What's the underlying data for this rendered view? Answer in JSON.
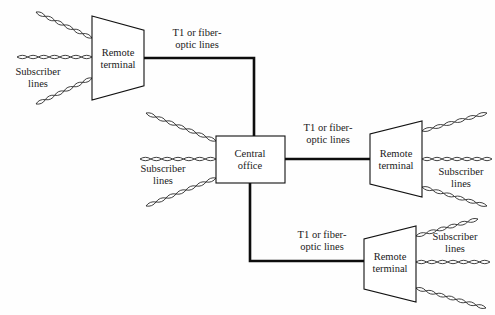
{
  "diagram": {
    "background_color": "#fefefe",
    "line_color": "#0d0d0d",
    "node_fill": "#ffffff",
    "nodes": [
      {
        "id": "rt-top-left",
        "label_line1": "Remote",
        "label_line2": "terminal",
        "shape": "trapezoid-left",
        "x": 92,
        "y": 16,
        "w": 52,
        "h": 84,
        "cx": 118,
        "cy": 58
      },
      {
        "id": "central-office",
        "label_line1": "Central",
        "label_line2": "office",
        "shape": "rectangle",
        "x": 216,
        "y": 136,
        "w": 69,
        "h": 47,
        "cx": 250,
        "cy": 159
      },
      {
        "id": "rt-mid-right",
        "label_line1": "Remote",
        "label_line2": "terminal",
        "shape": "trapezoid-right",
        "x": 370,
        "y": 121,
        "w": 52,
        "h": 76,
        "cx": 396,
        "cy": 159
      },
      {
        "id": "rt-bottom-right",
        "label_line1": "Remote",
        "label_line2": "terminal",
        "shape": "trapezoid-right",
        "x": 364,
        "y": 226,
        "w": 52,
        "h": 76,
        "cx": 390,
        "cy": 262
      }
    ],
    "trunk_labels": [
      {
        "id": "trunk-label-top",
        "line1": "T1 or fiber-",
        "line2": "optic lines",
        "x": 197,
        "y": 36
      },
      {
        "id": "trunk-label-mid",
        "line1": "T1 or fiber-",
        "line2": "optic lines",
        "x": 328,
        "y": 131
      },
      {
        "id": "trunk-label-bottom",
        "line1": "T1 or fiber-",
        "line2": "optic lines",
        "x": 322,
        "y": 238
      }
    ],
    "subscriber_labels": [
      {
        "id": "sub-label-top-left",
        "line1": "Subscriber",
        "line2": "lines",
        "x": 38,
        "y": 75
      },
      {
        "id": "sub-label-center",
        "line1": "Subscriber",
        "line2": "lines",
        "x": 163,
        "y": 172
      },
      {
        "id": "sub-label-mid-right",
        "line1": "Subscriber",
        "line2": "lines",
        "x": 461,
        "y": 175
      },
      {
        "id": "sub-label-bottom-right",
        "line1": "Subscriber",
        "line2": "lines",
        "x": 455,
        "y": 240
      }
    ],
    "trunk_paths": [
      {
        "id": "trunk-top",
        "d": "M 144 58 L 254 58 L 254 136"
      },
      {
        "id": "trunk-mid",
        "d": "M 285 159 L 370 159"
      },
      {
        "id": "trunk-bottom",
        "d": "M 250 183 L 250 261 L 364 261"
      }
    ],
    "subscriber_links": [
      {
        "id": "sub-top-left-upper",
        "x1": 36,
        "y1": 12,
        "x2": 92,
        "y2": 38
      },
      {
        "id": "sub-top-left-middle",
        "x1": 17,
        "y1": 57,
        "x2": 92,
        "y2": 57
      },
      {
        "id": "sub-top-left-lower",
        "x1": 36,
        "y1": 104,
        "x2": 92,
        "y2": 78
      },
      {
        "id": "sub-central-upper",
        "x1": 146,
        "y1": 113,
        "x2": 216,
        "y2": 141
      },
      {
        "id": "sub-central-middle",
        "x1": 140,
        "y1": 159,
        "x2": 216,
        "y2": 159
      },
      {
        "id": "sub-central-lower",
        "x1": 146,
        "y1": 206,
        "x2": 216,
        "y2": 178
      },
      {
        "id": "sub-mid-right-upper",
        "x1": 422,
        "y1": 131,
        "x2": 487,
        "y2": 113
      },
      {
        "id": "sub-mid-right-middle",
        "x1": 422,
        "y1": 159,
        "x2": 492,
        "y2": 159
      },
      {
        "id": "sub-mid-right-lower",
        "x1": 422,
        "y1": 187,
        "x2": 487,
        "y2": 206
      },
      {
        "id": "sub-bottom-right-upper",
        "x1": 416,
        "y1": 236,
        "x2": 478,
        "y2": 219
      },
      {
        "id": "sub-bottom-right-middle",
        "x1": 416,
        "y1": 262,
        "x2": 490,
        "y2": 262
      },
      {
        "id": "sub-bottom-right-lower",
        "x1": 416,
        "y1": 288,
        "x2": 486,
        "y2": 308
      }
    ],
    "twist_style": {
      "loop_length": 10.5,
      "loop_amplitude": 3.4
    }
  }
}
